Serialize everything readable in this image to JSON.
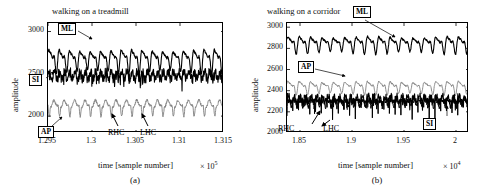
{
  "figure": {
    "axis_label_y": "amplitude",
    "axis_label_x": "time [sample number]"
  },
  "panels": [
    {
      "id": "a",
      "caption": "(a)",
      "title": "walking on a treadmill",
      "ylabel": "amplitude",
      "xlabel": "time [sample number]",
      "x_exponent_text": "× 10",
      "x_exponent_power": "5",
      "yticks": [
        "2000",
        "2500",
        "3000"
      ],
      "ytick_values": [
        2000,
        2500,
        3000
      ],
      "xticks": [
        "1.295",
        "1.3",
        "1.305",
        "1.31",
        "1.315"
      ],
      "xtick_values": [
        1.295,
        1.3,
        1.305,
        1.31,
        1.315
      ],
      "ylim": [
        1800,
        3100
      ],
      "xlim": [
        1.295,
        1.315
      ],
      "annotations": [
        {
          "name": "ml",
          "text": "ML",
          "style": "box"
        },
        {
          "name": "si",
          "text": "SI",
          "style": "box"
        },
        {
          "name": "ap",
          "text": "AP",
          "style": "box"
        },
        {
          "name": "rhc",
          "text": "RHC",
          "style": "plain"
        },
        {
          "name": "lhc",
          "text": "LHC",
          "style": "plain"
        }
      ]
    },
    {
      "id": "b",
      "caption": "(b)",
      "title": "walking on a corridor",
      "ylabel": "amplitude",
      "xlabel": "time [sample number]",
      "x_exponent_text": "× 10",
      "x_exponent_power": "4",
      "yticks": [
        "2000",
        "2200",
        "2400",
        "2600",
        "2800",
        "3000"
      ],
      "ytick_values": [
        2000,
        2200,
        2400,
        2600,
        2800,
        3000
      ],
      "xticks": [
        "1.85",
        "1.9",
        "1.95",
        "2"
      ],
      "xtick_values": [
        1.85,
        1.9,
        1.95,
        2.0
      ],
      "ylim": [
        2000,
        3040
      ],
      "xlim": [
        1.8375,
        2.0125
      ],
      "annotations": [
        {
          "name": "ml",
          "text": "ML",
          "style": "box"
        },
        {
          "name": "ap",
          "text": "AP",
          "style": "box"
        },
        {
          "name": "si",
          "text": "SI",
          "style": "box"
        },
        {
          "name": "rhc",
          "text": "RHC",
          "style": "plain"
        },
        {
          "name": "lhc",
          "text": "LHC",
          "style": "plain"
        }
      ]
    }
  ],
  "chart_data": [
    {
      "type": "line",
      "panel": "a",
      "title": "walking on a treadmill",
      "xlabel": "time [sample number]",
      "ylabel": "amplitude",
      "xlim": [
        1.295,
        1.315
      ],
      "ylim": [
        1800,
        3100
      ],
      "x_scale": 100000,
      "xticks": [
        1.295,
        1.3,
        1.305,
        1.31,
        1.315
      ],
      "yticks": [
        2000,
        2500,
        3000
      ],
      "grid": false,
      "legend": "inline-boxed-labels",
      "series": [
        {
          "name": "ML",
          "color": "#000000",
          "baseline": 2680,
          "amplitude": 150,
          "cycles": 17,
          "style": "peaky"
        },
        {
          "name": "SI",
          "color": "#000000",
          "baseline": 2480,
          "amplitude": 95,
          "cycles": 34,
          "style": "spiky"
        },
        {
          "name": "AP",
          "color": "#808080",
          "baseline": 2110,
          "amplitude": 130,
          "cycles": 17,
          "style": "trough"
        }
      ]
    },
    {
      "type": "line",
      "panel": "b",
      "title": "walking on a corridor",
      "xlabel": "time [sample number]",
      "ylabel": "amplitude",
      "xlim": [
        1.8375,
        2.0125
      ],
      "ylim": [
        2000,
        3040
      ],
      "x_scale": 10000,
      "xticks": [
        1.85,
        1.9,
        1.95,
        2.0
      ],
      "yticks": [
        2000,
        2200,
        2400,
        2600,
        2800,
        3000
      ],
      "grid": false,
      "legend": "inline-boxed-labels",
      "series": [
        {
          "name": "ML",
          "color": "#000000",
          "baseline": 2850,
          "amplitude": 90,
          "cycles": 16,
          "style": "peaky"
        },
        {
          "name": "AP",
          "color": "#808080",
          "baseline": 2440,
          "amplitude": 70,
          "cycles": 16,
          "style": "peaky"
        },
        {
          "name": "SI",
          "color": "#000000",
          "baseline": 2320,
          "amplitude": 60,
          "cycles": 32,
          "style": "spiky"
        }
      ]
    }
  ]
}
